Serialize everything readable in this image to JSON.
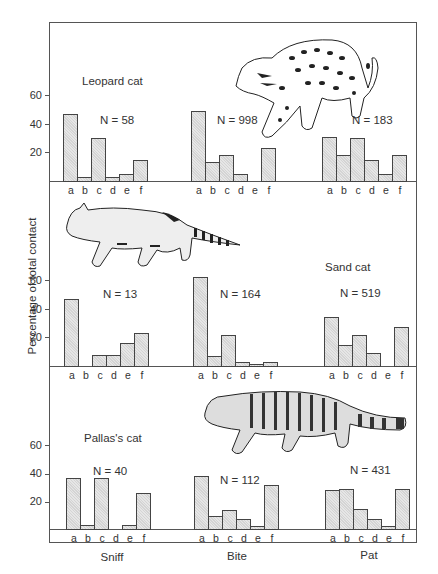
{
  "chart_data": {
    "type": "bar",
    "ylabel": "Percentage of total contact",
    "categories": [
      "a",
      "b",
      "c",
      "d",
      "e",
      "f"
    ],
    "groups": [
      "Sniff",
      "Bite",
      "Pat"
    ],
    "yticks": [
      20,
      40,
      60
    ],
    "ylim": [
      0,
      70
    ],
    "panels": [
      {
        "species": "Leopard cat",
        "groups": [
          {
            "name": "Sniff",
            "n_label": "N = 58",
            "values": [
              47,
              3,
              30,
              3,
              5,
              15
            ]
          },
          {
            "name": "Bite",
            "n_label": "N = 998",
            "values": [
              49,
              13,
              18,
              5,
              0,
              23
            ]
          },
          {
            "name": "Pat",
            "n_label": "N = 183",
            "values": [
              31,
              18,
              30,
              15,
              5,
              18
            ]
          }
        ]
      },
      {
        "species": "Sand cat",
        "groups": [
          {
            "name": "Sniff",
            "n_label": "N = 13",
            "values": [
              47,
              0,
              8,
              8,
              16,
              23
            ]
          },
          {
            "name": "Bite",
            "n_label": "N = 164",
            "values": [
              62,
              7,
              22,
              3,
              1,
              3
            ]
          },
          {
            "name": "Pat",
            "n_label": "N = 519",
            "values": [
              34,
              15,
              22,
              9,
              0,
              27
            ]
          }
        ]
      },
      {
        "species": "Pallas's cat",
        "groups": [
          {
            "name": "Sniff",
            "n_label": "N = 40",
            "values": [
              36,
              3,
              36,
              0,
              3,
              25
            ]
          },
          {
            "name": "Bite",
            "n_label": "N = 112",
            "values": [
              37,
              9,
              13,
              7,
              2,
              31
            ]
          },
          {
            "name": "Pat",
            "n_label": "N = 431",
            "values": [
              27,
              28,
              14,
              7,
              2,
              28
            ]
          }
        ]
      }
    ],
    "grid": false,
    "legend": "none"
  },
  "labels": {
    "ylabel": "Percentage of total contact",
    "xgroups": [
      "Sniff",
      "Bite",
      "Pat"
    ],
    "species": [
      "Leopard cat",
      "Sand cat",
      "Pallas's cat"
    ]
  },
  "illustrations": [
    "leopard-cat-drawing",
    "sand-cat-drawing",
    "pallas-cat-drawing"
  ]
}
